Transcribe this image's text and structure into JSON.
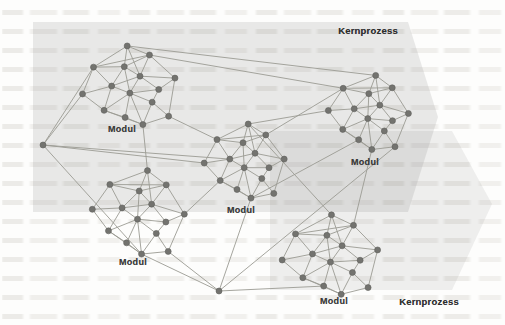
{
  "figure": {
    "arrows": [
      {
        "label": "Kernprozess",
        "label_pos": [
          368,
          30
        ],
        "points": [
          [
            33,
            22
          ],
          [
            408,
            22
          ],
          [
            438,
            117
          ],
          [
            408,
            212
          ],
          [
            33,
            212
          ]
        ],
        "fill": "rgba(122,122,122,0.155)"
      },
      {
        "label": "Kernprozess",
        "label_pos": [
          429,
          301
        ],
        "points": [
          [
            270,
            131
          ],
          [
            452,
            131
          ],
          [
            492,
            204
          ],
          [
            452,
            290
          ],
          [
            270,
            290
          ]
        ],
        "fill": "rgba(122,122,122,0.11)"
      }
    ],
    "network": {
      "node_color": "#73736f",
      "node_stroke": "#5f5f5c",
      "edge_color": "#9b9b94",
      "node_radius": 3,
      "cluster_template": {
        "nodes": [
          [
            0.08,
            -1.0
          ],
          [
            -0.7,
            -0.6
          ],
          [
            0.52,
            -0.72
          ],
          [
            -0.05,
            -0.52
          ],
          [
            0.98,
            -0.1
          ],
          [
            -1.02,
            0.0
          ],
          [
            -0.38,
            -0.1
          ],
          [
            0.25,
            -0.25
          ],
          [
            0.6,
            0.12
          ],
          [
            -0.62,
            0.45
          ],
          [
            -0.02,
            0.12
          ],
          [
            0.42,
            0.4
          ],
          [
            -0.2,
            0.68
          ],
          [
            0.15,
            0.9
          ],
          [
            0.72,
            0.78
          ]
        ],
        "edges": [
          [
            0,
            1
          ],
          [
            0,
            2
          ],
          [
            0,
            3
          ],
          [
            0,
            7
          ],
          [
            1,
            3
          ],
          [
            1,
            5
          ],
          [
            1,
            6
          ],
          [
            1,
            2
          ],
          [
            2,
            3
          ],
          [
            2,
            7
          ],
          [
            2,
            4
          ],
          [
            3,
            6
          ],
          [
            3,
            7
          ],
          [
            3,
            10
          ],
          [
            4,
            7
          ],
          [
            4,
            8
          ],
          [
            4,
            14
          ],
          [
            5,
            6
          ],
          [
            5,
            9
          ],
          [
            6,
            7
          ],
          [
            6,
            9
          ],
          [
            6,
            10
          ],
          [
            7,
            8
          ],
          [
            7,
            10
          ],
          [
            8,
            10
          ],
          [
            8,
            11
          ],
          [
            9,
            10
          ],
          [
            9,
            12
          ],
          [
            9,
            13
          ],
          [
            10,
            11
          ],
          [
            10,
            12
          ],
          [
            10,
            13
          ],
          [
            11,
            13
          ],
          [
            11,
            14
          ],
          [
            12,
            13
          ],
          [
            13,
            14
          ]
        ]
      },
      "clusters": [
        {
          "label": "Modul",
          "center": [
            130,
            88
          ],
          "scale": [
            47,
            42
          ],
          "rotation": -8,
          "label_pos": [
            122,
            129
          ]
        },
        {
          "label": "Modul",
          "center": [
            369,
            114
          ],
          "scale": [
            40,
            39
          ],
          "rotation": 5,
          "label_pos": [
            365,
            162
          ]
        },
        {
          "label": "Modul",
          "center": [
            245,
            163
          ],
          "scale": [
            40,
            39
          ],
          "rotation": 0,
          "label_pos": [
            241,
            210
          ]
        },
        {
          "label": "Modul",
          "center": [
            139,
            214
          ],
          "scale": [
            46,
            44
          ],
          "rotation": 6,
          "label_pos": [
            133,
            262
          ]
        },
        {
          "label": "Modul",
          "center": [
            331,
            257
          ],
          "scale": [
            48,
            42
          ],
          "rotation": -4,
          "label_pos": [
            334,
            301
          ]
        }
      ],
      "hubs": [
        [
          43,
          145
        ],
        [
          219,
          291
        ]
      ],
      "inter_edges": [
        [
          [
            "c",
            0,
            0
          ],
          [
            "c",
            1,
            0
          ]
        ],
        [
          [
            "c",
            0,
            2
          ],
          [
            "c",
            1,
            1
          ]
        ],
        [
          [
            "h",
            0
          ],
          [
            "c",
            0,
            1
          ]
        ],
        [
          [
            "h",
            0
          ],
          [
            "c",
            0,
            5
          ]
        ],
        [
          [
            "h",
            0
          ],
          [
            "c",
            2,
            5
          ]
        ],
        [
          [
            "h",
            0
          ],
          [
            "c",
            2,
            6
          ]
        ],
        [
          [
            "h",
            0
          ],
          [
            "c",
            3,
            13
          ]
        ],
        [
          [
            "c",
            0,
            13
          ],
          [
            "c",
            3,
            0
          ]
        ],
        [
          [
            "c",
            0,
            14
          ],
          [
            "c",
            2,
            1
          ]
        ],
        [
          [
            "c",
            2,
            2
          ],
          [
            "c",
            1,
            1
          ]
        ],
        [
          [
            "c",
            2,
            0
          ],
          [
            "c",
            1,
            5
          ]
        ],
        [
          [
            "h",
            1
          ],
          [
            "c",
            2,
            13
          ]
        ],
        [
          [
            "h",
            1
          ],
          [
            "c",
            3,
            14
          ]
        ],
        [
          [
            "h",
            1
          ],
          [
            "c",
            4,
            12
          ]
        ],
        [
          [
            "h",
            1
          ],
          [
            "c",
            1,
            14
          ]
        ],
        [
          [
            "c",
            2,
            13
          ],
          [
            "c",
            1,
            12
          ]
        ],
        [
          [
            "c",
            2,
            0
          ],
          [
            "c",
            4,
            0
          ]
        ],
        [
          [
            "c",
            3,
            4
          ],
          [
            "c",
            2,
            9
          ]
        ],
        [
          [
            "c",
            4,
            2
          ],
          [
            "c",
            1,
            13
          ]
        ],
        [
          [
            "c",
            3,
            13
          ],
          [
            "h",
            1
          ]
        ]
      ]
    }
  }
}
